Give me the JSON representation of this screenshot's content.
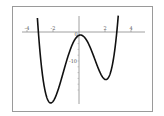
{
  "chart_data": {
    "type": "line",
    "title": "",
    "xlabel": "",
    "ylabel": "",
    "x_ticks": [
      -4,
      -2,
      0,
      2,
      4
    ],
    "x_tick_labels": [
      "-4",
      "-2",
      "0",
      "2",
      "4"
    ],
    "y_ticks": [
      -10
    ],
    "y_tick_labels": [
      "-10"
    ],
    "xlim": [
      -4.2,
      4.2
    ],
    "ylim": [
      -24,
      7
    ],
    "grid": false,
    "series": [
      {
        "name": "f(x)",
        "function": "x^4 - 9x^2 + 2x - 1",
        "x": [
          -3.6,
          -3.4,
          -3.2,
          -3.0,
          -2.8,
          -2.6,
          -2.4,
          -2.2,
          -2.0,
          -1.8,
          -1.6,
          -1.4,
          -1.2,
          -1.0,
          -0.8,
          -0.6,
          -0.4,
          -0.2,
          0.0,
          0.2,
          0.4,
          0.6,
          0.8,
          1.0,
          1.2,
          1.4,
          1.6,
          1.8,
          2.0,
          2.2,
          2.4,
          2.6,
          2.8,
          3.0,
          3.2,
          3.4,
          3.6
        ],
        "values": [
          44.0,
          16.6,
          -1.2,
          -7.0,
          -15.7,
          -19.3,
          -19.8,
          -19.5,
          -25.0,
          -20.3,
          -17.1,
          -14.6,
          -11.2,
          -11.0,
          -7.4,
          -5.3,
          -3.2,
          -1.8,
          -1.0,
          -0.96,
          -1.6,
          -2.8,
          -4.7,
          -7.0,
          -9.5,
          -11.9,
          -13.5,
          -13.9,
          -13.0,
          -10.2,
          -5.8,
          0.6,
          9.7,
          14.0,
          36.1,
          51.2,
          76.0
        ],
        "color": "#111111"
      }
    ]
  }
}
